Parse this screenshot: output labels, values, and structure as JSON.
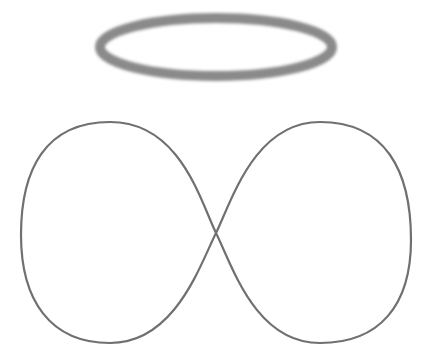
{
  "scene": {
    "description": "Angel halo above an infinity / figure-eight outline",
    "background": "#ffffff",
    "halo": {
      "shape": "ellipse",
      "cx": 216,
      "cy": 47,
      "rx": 116,
      "ry": 29,
      "stroke": "#8a8a8a",
      "stroke_width": 10,
      "blurred": true
    },
    "figure_eight": {
      "shape": "lemniscate",
      "cross_point": [
        216,
        233
      ],
      "left_extent": 21,
      "right_extent": 411,
      "top": 122,
      "bottom": 343,
      "stroke": "#707070",
      "stroke_width": 2.2
    }
  }
}
